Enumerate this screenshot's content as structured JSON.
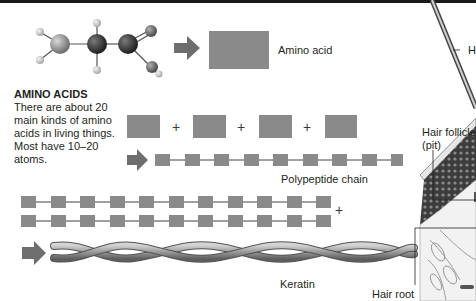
{
  "diagram": {
    "molecule_label": "Amino acid",
    "section_heading": "AMINO ACIDS",
    "description": "There are about 20 main kinds of amino acids in living things. Most have 10–20 atoms.",
    "plus_symbol": "+",
    "polypeptide_label": "Polypeptide chain",
    "keratin_label": "Keratin",
    "hair_label_partial": "H",
    "hair_follicle_label": "Hair follicle",
    "hair_follicle_sub": "(pit)",
    "hair_root_label": "Hair root",
    "icons": {
      "process_arrow": "arrow-right-icon",
      "amino_acid_block": "square-block",
      "molecule": "ball-and-stick-molecule"
    },
    "counts": {
      "amino_blocks_row": 4,
      "polypeptide_units": 11,
      "chain_rows": 2,
      "chain_units_per_row": 11
    },
    "colors": {
      "block": "#8a8a8a",
      "arrow": "#6e6e6e",
      "text": "#231f20",
      "top_border": "#1a1a1a"
    }
  }
}
